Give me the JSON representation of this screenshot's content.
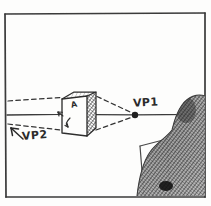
{
  "sketch": {
    "title": "One-point perspective study",
    "medium": "pencil on paper",
    "paper_color": "#fdfdfc",
    "ink_color": "#2b2b2b"
  },
  "labels": {
    "vp1": "VP1",
    "vp2": "VP2",
    "cube_face": "A"
  },
  "annotations": {
    "horizon_line": "horizon line",
    "vanishing_point_dot": "vanishing point 1 marker",
    "dashed_guides": "perspective convergence guides",
    "cube": "shaded cube",
    "figure": "seated person silhouette",
    "desk": "desk edge"
  },
  "geometry": {
    "frame": {
      "x": 5,
      "y": 13,
      "width": 200,
      "height": 184
    },
    "horizon_y": 114,
    "vp1_point": {
      "x": 135,
      "y": 115
    },
    "cube_bounds": {
      "x": 60,
      "y": 92,
      "width": 36,
      "height": 44
    }
  },
  "colors": {
    "ink": "#2b2b2b",
    "paper": "#fdfdfc",
    "shading": "#555555",
    "frame_border": "#3a3a3a"
  }
}
